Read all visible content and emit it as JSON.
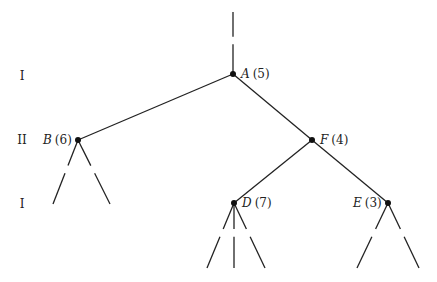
{
  "diagram": {
    "type": "game-tree",
    "levels": [
      {
        "label": "I",
        "y": 76
      },
      {
        "label": "II",
        "y": 140
      },
      {
        "label": "I",
        "y": 204
      }
    ],
    "nodes": [
      {
        "id": "A",
        "name": "A",
        "value": "(5)",
        "x": 233,
        "y": 74,
        "label_side": "right"
      },
      {
        "id": "B",
        "name": "B",
        "value": "(6)",
        "x": 78,
        "y": 140,
        "label_side": "left"
      },
      {
        "id": "F",
        "name": "F",
        "value": "(4)",
        "x": 312,
        "y": 140,
        "label_side": "right"
      },
      {
        "id": "D",
        "name": "D",
        "value": "(7)",
        "x": 234,
        "y": 203,
        "label_side": "right"
      },
      {
        "id": "E",
        "name": "E",
        "value": "(3)",
        "x": 388,
        "y": 203,
        "label_side": "left"
      }
    ],
    "edges": [
      {
        "from": "A",
        "to": "B"
      },
      {
        "from": "A",
        "to": "F"
      },
      {
        "from": "F",
        "to": "D"
      },
      {
        "from": "F",
        "to": "E"
      }
    ],
    "dashed_stubs": [
      {
        "from": [
          233,
          12
        ],
        "to": [
          233,
          74
        ]
      },
      {
        "from": [
          78,
          140
        ],
        "to": [
          53,
          204
        ]
      },
      {
        "from": [
          78,
          140
        ],
        "to": [
          110,
          204
        ]
      },
      {
        "from": [
          234,
          203
        ],
        "to": [
          207,
          268
        ]
      },
      {
        "from": [
          234,
          203
        ],
        "to": [
          234,
          268
        ]
      },
      {
        "from": [
          234,
          203
        ],
        "to": [
          265,
          268
        ]
      },
      {
        "from": [
          388,
          203
        ],
        "to": [
          357,
          268
        ]
      },
      {
        "from": [
          388,
          203
        ],
        "to": [
          419,
          268
        ]
      }
    ]
  }
}
